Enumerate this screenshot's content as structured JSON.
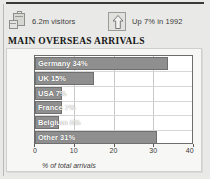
{
  "header": {
    "stats": [
      {
        "icon": "suitcase-icon",
        "label": "6.2m visitors"
      },
      {
        "icon": "up-arrow-icon",
        "label": "Up 7% in 1992"
      }
    ]
  },
  "chart_title": "MAIN OVERSEAS ARRIVALS",
  "axis_caption": "% of total arrivals",
  "colors": {
    "bar_fill": "#8f8f8f",
    "bar_stroke": "#6f6f6f",
    "plot_bg": "#ffffff",
    "panel_bg": "#f7f7f5",
    "page_bg": "#e9e9e7",
    "grid": "#c9c9c9",
    "label_text": "#ffffff"
  },
  "chart_data": {
    "type": "bar",
    "orientation": "horizontal",
    "title": "MAIN OVERSEAS ARRIVALS",
    "xlabel": "% of total arrivals",
    "ylabel": "",
    "xlim": [
      0,
      40
    ],
    "xticks": [
      0,
      10,
      20,
      30,
      40
    ],
    "xtick_labels": [
      "0",
      "10",
      "20",
      "30",
      "40"
    ],
    "grid": true,
    "legend": "none",
    "categories": [
      "Germany",
      "UK",
      "USA",
      "France",
      "Belgium",
      "Other"
    ],
    "values": [
      34,
      15,
      7,
      7,
      6,
      31
    ],
    "bar_labels": [
      "Germany 34%",
      "UK 15%",
      "USA 7%",
      "France 7%",
      "Belgium 6%",
      "Other 31%"
    ]
  }
}
